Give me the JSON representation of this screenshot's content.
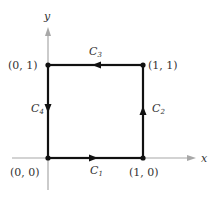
{
  "diagram": {
    "type": "closed-path-square",
    "axes": {
      "x_label": "x",
      "y_label": "y",
      "color": "#a8a8a8"
    },
    "path_color": "#111111",
    "vertices": [
      {
        "id": "origin",
        "label": "(0, 0)"
      },
      {
        "id": "bottom-right",
        "label": "(1, 0)"
      },
      {
        "id": "top-right",
        "label": "(1, 1)"
      },
      {
        "id": "top-left",
        "label": "(0, 1)"
      }
    ],
    "segments": [
      {
        "id": "c1",
        "base": "C",
        "sub": "1",
        "from": "(0, 0)",
        "to": "(1, 0)",
        "direction": "right"
      },
      {
        "id": "c2",
        "base": "C",
        "sub": "2",
        "from": "(1, 0)",
        "to": "(1, 1)",
        "direction": "up"
      },
      {
        "id": "c3",
        "base": "C",
        "sub": "3",
        "from": "(1, 1)",
        "to": "(0, 1)",
        "direction": "left"
      },
      {
        "id": "c4",
        "base": "C",
        "sub": "4",
        "from": "(0, 1)",
        "to": "(0, 0)",
        "direction": "down"
      }
    ]
  }
}
